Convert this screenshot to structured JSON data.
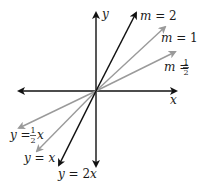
{
  "diagram": {
    "axes": {
      "x_label": "x",
      "y_label": "y",
      "color": "#1a1a1a"
    },
    "lines": [
      {
        "id": "slope-2",
        "slope": "2",
        "upper_label_var": "m",
        "upper_label_eq": " = ",
        "upper_label_val": "2",
        "lower_label_var": "y",
        "lower_label_eq": " = ",
        "lower_label_coef": "2",
        "lower_label_x": "x",
        "color": "#111111"
      },
      {
        "id": "slope-1",
        "slope": "1",
        "upper_label_var": "m",
        "upper_label_eq": " = ",
        "upper_label_val": "1",
        "lower_label_var": "y",
        "lower_label_eq": " = ",
        "lower_label_x": "x",
        "color": "#9a9a9a"
      },
      {
        "id": "slope-half",
        "slope": "1/2",
        "upper_label_var": "m",
        "upper_label_eq": " = ",
        "frac_num": "1",
        "frac_den": "2",
        "lower_label_var": "y",
        "lower_label_eq": " = ",
        "lower_label_x": "x",
        "color": "#9a9a9a"
      }
    ]
  }
}
